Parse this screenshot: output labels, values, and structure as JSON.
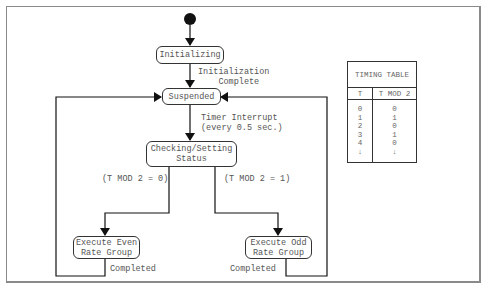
{
  "diagram": {
    "states": {
      "initializing": "Initializing",
      "suspended": "Suspended",
      "checking": "Checking/Setting\nStatus",
      "even": "Execute Even\nRate Group",
      "odd": "Execute Odd\nRate Group"
    },
    "transitions": {
      "init_complete": "Initialization\n    Complete",
      "timer_interrupt": "Timer Interrupt\n(every 0.5 sec.)",
      "mod_zero": "(T MOD 2 = 0)",
      "mod_one": "(T MOD 2 = 1)",
      "even_completed": "Completed",
      "odd_completed": "Completed"
    },
    "line_color": "#222222",
    "text_color": "#555555"
  },
  "timing_table": {
    "title": "TIMING TABLE",
    "columns": [
      "T",
      "T MOD 2"
    ],
    "rows": [
      [
        "0",
        "0"
      ],
      [
        "1",
        "1"
      ],
      [
        "2",
        "0"
      ],
      [
        "3",
        "1"
      ],
      [
        "4",
        "0"
      ],
      [
        "↓",
        "↓"
      ]
    ],
    "col_t_text": "0\n1\n2\n3\n4\n↓",
    "col_mod_text": "0\n1\n0\n1\n0\n↓"
  }
}
